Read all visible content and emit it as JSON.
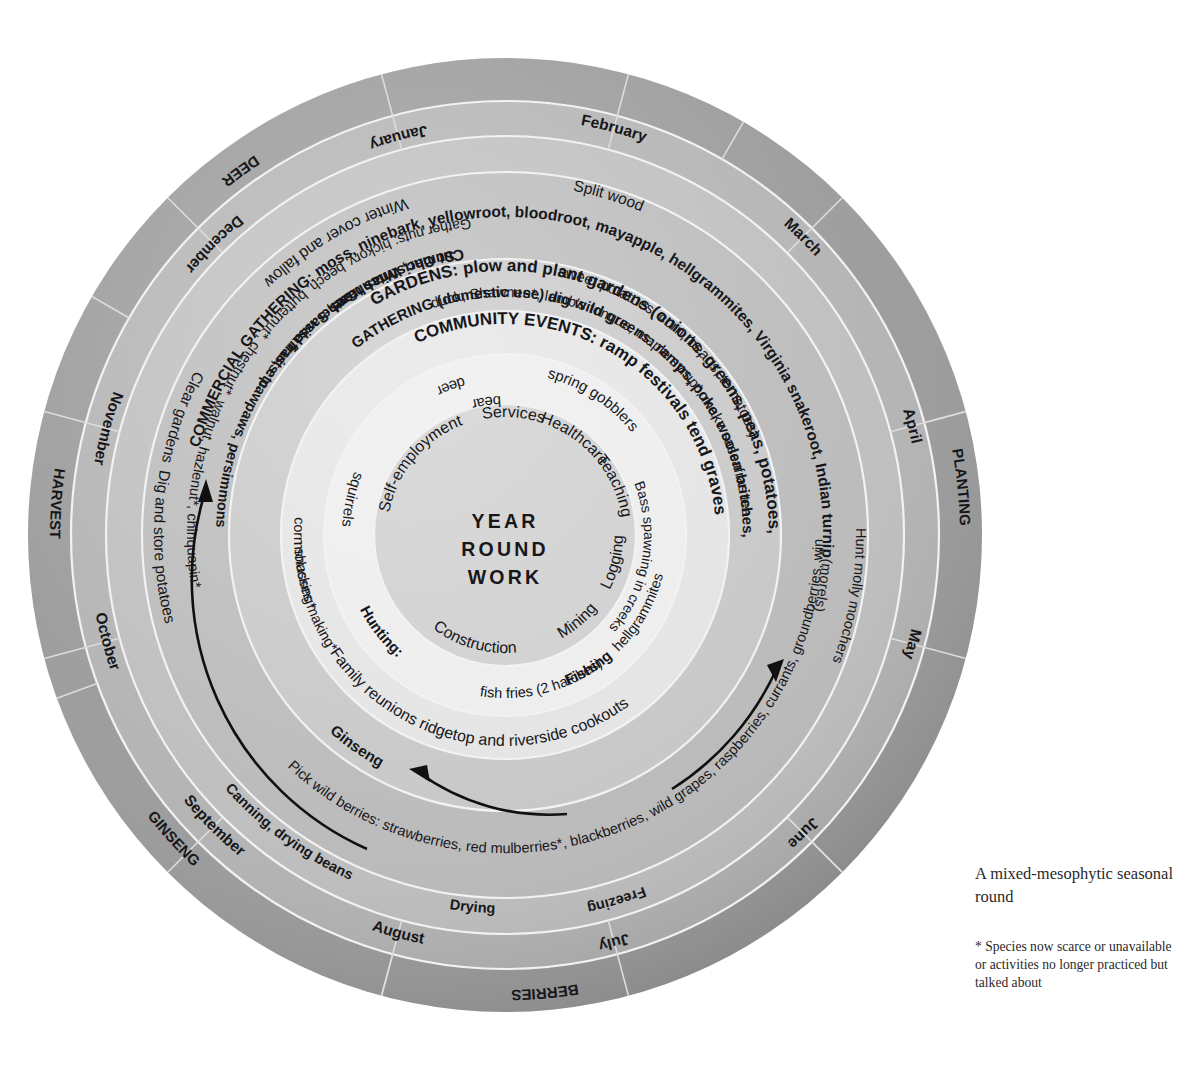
{
  "figure": {
    "type": "circular seasonal round diagram",
    "center_label_lines": [
      "YEAR",
      "ROUND",
      "WORK"
    ],
    "legend_title": "A mixed-mesophytic seasonal round",
    "legend_note": "* Species now scarce or unavailable or activities no longer practiced but talked about"
  },
  "colors": {
    "outer_season_ring": "#9a9a9a",
    "month_ring": "#b0b0b0",
    "activity_ring": "#bcbcbc",
    "gathering_ring": "#c8c8c8",
    "community_ring": "#d8d8d8",
    "inner_ring": "#e9e9e9",
    "core": "#cfcfcf",
    "text": "#17171a",
    "season_text": "#ffffff",
    "divider": "#e8e8e8",
    "background": "#ffffff"
  },
  "rings": {
    "seasons": {
      "name": "outer season band",
      "items": [
        {
          "label": "DEER",
          "start": 300,
          "end": 348
        },
        {
          "label": "PLANTING",
          "start": 60,
          "end": 108
        },
        {
          "label": "BERRIES",
          "start": 150,
          "end": 200
        },
        {
          "label": "GINSENG",
          "start": 205,
          "end": 250
        },
        {
          "label": "HARVEST",
          "start": 252,
          "end": 296
        }
      ]
    },
    "months": {
      "name": "month band",
      "items": [
        {
          "label": "January",
          "start": 330,
          "end": 0
        },
        {
          "label": "February",
          "start": 0,
          "end": 30
        },
        {
          "label": "March",
          "start": 30,
          "end": 60
        },
        {
          "label": "April",
          "start": 60,
          "end": 90
        },
        {
          "label": "May",
          "start": 90,
          "end": 120
        },
        {
          "label": "June",
          "start": 120,
          "end": 150
        },
        {
          "label": "July",
          "start": 150,
          "end": 180
        },
        {
          "label": "August",
          "start": 180,
          "end": 210
        },
        {
          "label": "September",
          "start": 210,
          "end": 240
        },
        {
          "label": "October",
          "start": 240,
          "end": 270
        },
        {
          "label": "November",
          "start": 270,
          "end": 300
        },
        {
          "label": "December",
          "start": 300,
          "end": 330
        }
      ]
    },
    "preservation": {
      "name": "food preservation band",
      "items": [
        {
          "label": "Freezing",
          "months": "July"
        },
        {
          "label": "Drying",
          "months": "July-August"
        },
        {
          "label": "Canning, drying beans",
          "months": "August-September"
        }
      ]
    },
    "activities": {
      "name": "outer activity band",
      "items": [
        "Winter cover and fallow",
        "Split wood",
        "Clear gardens",
        "Dig and store potatoes",
        "Cut Christmas trees",
        "Sumac, Witchhazel, Sassafras, etc.",
        "Gather nuts: hickory, beech, butternut*, chestnut*, walnut, hazlenut*, chinquapin*",
        "Gather wild fruits: pawpaws, persimmons",
        "Pick wild berries: strawberries, red mulberries*, blackberries, wild grapes, raspberries, currants, groundberries, winebirries*, huckleberries*, elderberries*",
        "Hunt molly moochers (morels)"
      ]
    },
    "gathering": {
      "name": "gathering band",
      "items": [
        "GARDENS: plow and plant gardens (onions, greens, peas, potatoes, sweet potatoes, corn, beans, tomatoes)",
        "GATHERING (domestic use) dig wild greens: ramps, poke, woolen britches, duck, Shawnee*, lamb's tongue, maple syrup*, make sassafras tea",
        "COMMERCIAL GATHERING: moss, ninebark, yellowroot, bloodroot, mayapple, hellgrammites, Virginia snakeroot, Indian turnip",
        "Ginseng"
      ]
    },
    "community": {
      "name": "community events band",
      "items": [
        "COMMUNITY EVENTS: ramp festivals  tend graves",
        "Family reunions  ridgetop and riverside cookouts"
      ]
    },
    "inner": {
      "name": "hunting and fishing band",
      "items": [
        "Hunting:",
        "deer",
        "bear",
        "squirrels",
        "spring gobblers",
        "Fishing",
        "Bass spawning in creeks",
        "hellgrammites",
        "fish fries (2 hatches)"
      ]
    },
    "core": {
      "name": "year round work core",
      "items": [
        "Services",
        "Healthcare",
        "Teaching",
        "Logging",
        "Mining",
        "Construction",
        "Self-employment"
      ]
    }
  },
  "arrows": [
    {
      "name": "left-arrow-upward",
      "note": "curved arrow pointing up on left side"
    },
    {
      "name": "right-arrow-upward",
      "note": "curved arrow pointing up on right side"
    },
    {
      "name": "bottom-arrow-left",
      "note": "curved arrow pointing left at bottom"
    }
  ]
}
